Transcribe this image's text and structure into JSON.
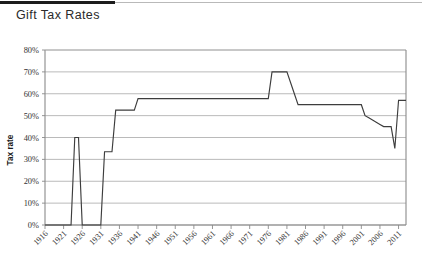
{
  "header": {
    "title": "Gift Tax Rates"
  },
  "chart_data": {
    "type": "line",
    "title": "Gift Tax Rates",
    "xlabel": "",
    "ylabel": "Tax rate",
    "ylim": [
      0,
      0.8
    ],
    "xlim": [
      1916,
      2013
    ],
    "grid": true,
    "legend": false,
    "y_tick_labels": [
      "0%",
      "10%",
      "20%",
      "30%",
      "40%",
      "50%",
      "60%",
      "70%",
      "80%"
    ],
    "y_tick_values": [
      0,
      0.1,
      0.2,
      0.3,
      0.4,
      0.5,
      0.6,
      0.7,
      0.8
    ],
    "x_tick_labels": [
      "1916",
      "1921",
      "1926",
      "1931",
      "1936",
      "1941",
      "1946",
      "1951",
      "1956",
      "1961",
      "1966",
      "1971",
      "1976",
      "1981",
      "1986",
      "1991",
      "1996",
      "2001",
      "2006",
      "2011"
    ],
    "x_tick_values": [
      1916,
      1921,
      1926,
      1931,
      1936,
      1941,
      1946,
      1951,
      1956,
      1961,
      1966,
      1971,
      1976,
      1981,
      1986,
      1991,
      1996,
      2001,
      2006,
      2011
    ],
    "line_color": "#3d3d3d",
    "grid_color": "#a8a8a8",
    "series": [
      {
        "name": "Gift tax top rate",
        "x": [
          1916,
          1923,
          1924,
          1925,
          1926,
          1931,
          1932,
          1934,
          1935,
          1940,
          1941,
          1976,
          1977,
          1981,
          1982,
          1983,
          1984,
          2001,
          2002,
          2003,
          2004,
          2005,
          2006,
          2007,
          2009,
          2010,
          2011,
          2013
        ],
        "values": [
          0,
          0,
          0.4,
          0.4,
          0,
          0,
          0.335,
          0.335,
          0.525,
          0.525,
          0.5775,
          0.5775,
          0.7,
          0.7,
          0.65,
          0.6,
          0.55,
          0.55,
          0.5,
          0.49,
          0.48,
          0.47,
          0.46,
          0.45,
          0.45,
          0.35,
          0.57,
          0.57
        ]
      }
    ]
  }
}
